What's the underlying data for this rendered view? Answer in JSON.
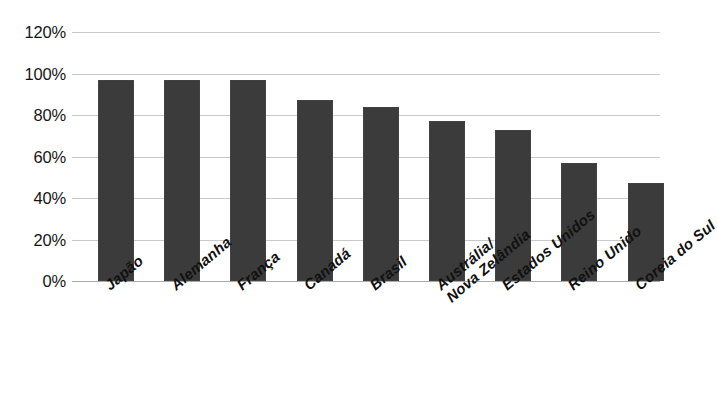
{
  "chart_data": {
    "type": "bar",
    "title": "",
    "subtitle": "",
    "xlabel": "",
    "ylabel": "",
    "ylim": [
      0,
      120
    ],
    "ytick_suffix": "%",
    "grid": true,
    "legend": "none",
    "orientation": "vertical",
    "bar_color": "#3b3b3b",
    "gridline_color": "#c9c9c9",
    "background_color": "#ffffff",
    "xtick_rotation": -40,
    "yticks": [
      {
        "value": 120,
        "label": "120%"
      },
      {
        "value": 100,
        "label": "100%"
      },
      {
        "value": 80,
        "label": "80%"
      },
      {
        "value": 60,
        "label": "60%"
      },
      {
        "value": 40,
        "label": "40%"
      },
      {
        "value": 20,
        "label": "20%"
      },
      {
        "value": 0,
        "label": "0%"
      }
    ],
    "categories": [
      "Japão",
      "Alemanha",
      "França",
      "Canadá",
      "Brasil",
      "Austrália/ Nova Zelândia",
      "Estados Unidos",
      "Reino Unido",
      "Coreia do Sul"
    ],
    "values": [
      97,
      97,
      97,
      87,
      84,
      77,
      73,
      57,
      47
    ],
    "bars": [
      {
        "category": "Japão",
        "label_line1": "Japão",
        "label_line2": "",
        "value": 97
      },
      {
        "category": "Alemanha",
        "label_line1": "Alemanha",
        "label_line2": "",
        "value": 97
      },
      {
        "category": "França",
        "label_line1": "França",
        "label_line2": "",
        "value": 97
      },
      {
        "category": "Canadá",
        "label_line1": "Canadá",
        "label_line2": "",
        "value": 87
      },
      {
        "category": "Brasil",
        "label_line1": "Brasil",
        "label_line2": "",
        "value": 84
      },
      {
        "category": "Austrália/ Nova Zelândia",
        "label_line1": "Austrália/",
        "label_line2": "Nova Zelândia",
        "value": 77
      },
      {
        "category": "Estados Unidos",
        "label_line1": "Estados Unidos",
        "label_line2": "",
        "value": 73
      },
      {
        "category": "Reino Unido",
        "label_line1": "Reino Unido",
        "label_line2": "",
        "value": 57
      },
      {
        "category": "Coreia do Sul",
        "label_line1": "Coreia do Sul",
        "label_line2": "",
        "value": 47
      }
    ]
  }
}
